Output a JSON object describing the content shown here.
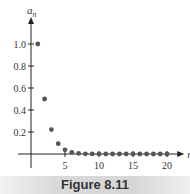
{
  "chart_data": {
    "type": "scatter",
    "title": "",
    "xlabel": "n",
    "ylabel": "a_n",
    "x": [
      1,
      2,
      3,
      4,
      5,
      6,
      7,
      8,
      9,
      10,
      11,
      12,
      13,
      14,
      15,
      16,
      17,
      18,
      19,
      20
    ],
    "values": [
      1.0,
      0.5,
      0.222,
      0.094,
      0.038,
      0.015,
      0.006,
      0.002,
      0.001,
      0.0004,
      0.0001,
      0.0,
      0.0,
      0.0,
      0.0,
      0.0,
      0.0,
      0.0,
      0.0,
      0.0
    ],
    "xticks": [
      5,
      10,
      15,
      20
    ],
    "yticks": [
      0.2,
      0.4,
      0.6,
      0.8,
      1.0
    ],
    "ytick_labels": [
      "0.2",
      "0.4",
      "0.6",
      "0.8",
      "1.0"
    ],
    "xtick_labels": [
      "5",
      "10",
      "15",
      "20"
    ],
    "xlim": [
      0,
      21
    ],
    "ylim": [
      0,
      1.1
    ],
    "grid": false,
    "point_color": "#555555"
  },
  "caption": "Figure 8.11"
}
